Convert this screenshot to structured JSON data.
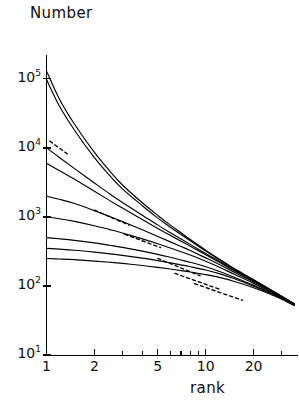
{
  "figure": {
    "width": 299,
    "height": 409,
    "background": "#ffffff",
    "ink_color": "#000000"
  },
  "labels": {
    "y_axis_title": "Number",
    "x_axis_title": "rank"
  },
  "axes": {
    "y_tick_labels": [
      "10",
      "10",
      "10",
      "10",
      "10"
    ],
    "y_tick_exponents": [
      "5",
      "4",
      "3",
      "2",
      "1"
    ],
    "x_tick_labels": [
      "1",
      "2",
      "5",
      "10",
      "20"
    ]
  },
  "chart_data": {
    "type": "line",
    "title": "",
    "xlabel": "rank",
    "ylabel": "Number",
    "xscale": "log",
    "yscale": "log",
    "xlim": [
      1,
      38
    ],
    "ylim": [
      10,
      200000
    ],
    "grid": false,
    "legend": "none",
    "x_ticks": [
      1,
      2,
      5,
      10,
      20
    ],
    "y_ticks": [
      10,
      100,
      1000,
      10000,
      100000
    ],
    "x_tick_labels": [
      "1",
      "2",
      "5",
      "10",
      "20"
    ],
    "y_tick_labels": [
      "10^1",
      "10^2",
      "10^3",
      "10^4",
      "10^5"
    ],
    "x": [
      1,
      1.2,
      1.5,
      2,
      2.5,
      3,
      4,
      5,
      6,
      7,
      8,
      10,
      12,
      15,
      20,
      28,
      36
    ],
    "series": [
      {
        "name": "curve-1",
        "style": "solid",
        "values": [
          130000,
          52000,
          22000,
          8600,
          4600,
          2900,
          1600,
          1050,
          760,
          590,
          470,
          330,
          250,
          180,
          123,
          78,
          55
        ]
      },
      {
        "name": "curve-2",
        "style": "solid",
        "values": [
          98000,
          41000,
          18000,
          7200,
          3950,
          2550,
          1450,
          960,
          710,
          555,
          450,
          320,
          245,
          178,
          122,
          78,
          55
        ]
      },
      {
        "name": "curve-3",
        "style": "solid",
        "values": [
          10000,
          7300,
          5000,
          3100,
          2150,
          1620,
          1060,
          760,
          590,
          480,
          400,
          295,
          232,
          172,
          120,
          77,
          55
        ]
      },
      {
        "name": "curve-4",
        "style": "solid",
        "values": [
          6000,
          4700,
          3500,
          2350,
          1720,
          1340,
          920,
          680,
          540,
          445,
          375,
          282,
          224,
          168,
          118,
          77,
          55
        ]
      },
      {
        "name": "curve-5",
        "style": "solid",
        "values": [
          2000,
          1800,
          1560,
          1230,
          1010,
          860,
          650,
          520,
          435,
          373,
          325,
          255,
          208,
          159,
          114,
          76,
          55
        ]
      },
      {
        "name": "curve-6",
        "style": "solid",
        "values": [
          1000,
          940,
          860,
          745,
          655,
          585,
          480,
          408,
          354,
          313,
          280,
          228,
          190,
          149,
          109,
          74,
          54
        ]
      },
      {
        "name": "curve-7",
        "style": "solid",
        "values": [
          500,
          482,
          457,
          420,
          388,
          362,
          320,
          287,
          260,
          238,
          220,
          190,
          165,
          135,
          102,
          72,
          53
        ]
      },
      {
        "name": "curve-8",
        "style": "solid",
        "values": [
          350,
          341,
          329,
          309,
          292,
          277,
          253,
          233,
          216,
          202,
          190,
          170,
          152,
          128,
          99,
          71,
          53
        ]
      },
      {
        "name": "curve-9",
        "style": "solid",
        "values": [
          250,
          246,
          240,
          229,
          220,
          212,
          198,
          186,
          176,
          167,
          159,
          146,
          134,
          117,
          94,
          69,
          52
        ]
      },
      {
        "name": "asymptote-1",
        "style": "dashed",
        "x": [
          1.05,
          1.35
        ],
        "values": [
          12500,
          8200
        ]
      },
      {
        "name": "asymptote-2",
        "style": "dashed",
        "x": [
          2.0,
          3.3
        ],
        "values": [
          1250,
          760
        ]
      },
      {
        "name": "asymptote-3",
        "style": "dashed",
        "x": [
          3.1,
          5.2
        ],
        "values": [
          560,
          360
        ]
      },
      {
        "name": "asymptote-4",
        "style": "dashed",
        "x": [
          5.0,
          9.2
        ],
        "values": [
          250,
          141
        ]
      },
      {
        "name": "asymptote-5",
        "style": "dashed",
        "x": [
          6.4,
          12.5
        ],
        "values": [
          152,
          88
        ]
      },
      {
        "name": "asymptote-6",
        "style": "dashed",
        "x": [
          8.5,
          17.0
        ],
        "values": [
          108,
          62
        ]
      }
    ]
  }
}
